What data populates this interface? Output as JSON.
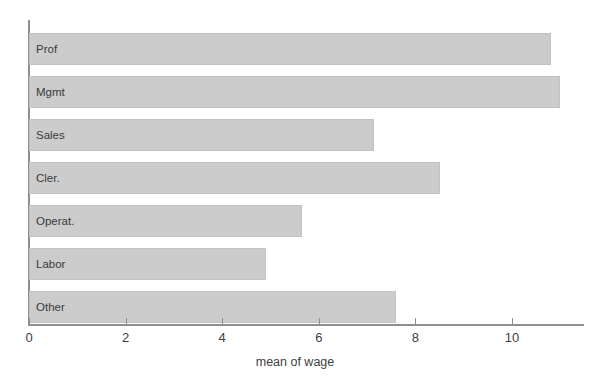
{
  "chart_data": {
    "type": "bar",
    "orientation": "horizontal",
    "title": "",
    "subtitle": "",
    "xlabel": "mean of wage",
    "ylabel": "",
    "categories": [
      "Prof",
      "Mgmt",
      "Sales",
      "Cler.",
      "Operat.",
      "Labor",
      "Other"
    ],
    "values": [
      10.8,
      11.0,
      7.15,
      8.5,
      5.65,
      4.9,
      7.6
    ],
    "series": [
      {
        "name": "mean of wage",
        "values": [
          10.8,
          11.0,
          7.15,
          8.5,
          5.65,
          4.9,
          7.6
        ]
      }
    ],
    "xlim": [
      0,
      11.5
    ],
    "xticks": [
      0,
      2,
      4,
      6,
      8,
      10
    ],
    "xtick_labels": [
      "0",
      "2",
      "4",
      "6",
      "8",
      "10"
    ],
    "grid": false,
    "legend": false,
    "legend_position": "none",
    "bar_color": "#cccccc",
    "bar_border_color": "#c2c2c2",
    "axis_color": "#8e8e8e",
    "text_color": "#404040",
    "label_color": "#3a3a3a",
    "background_color": "#ffffff",
    "category_labels_inside_bars": true
  }
}
